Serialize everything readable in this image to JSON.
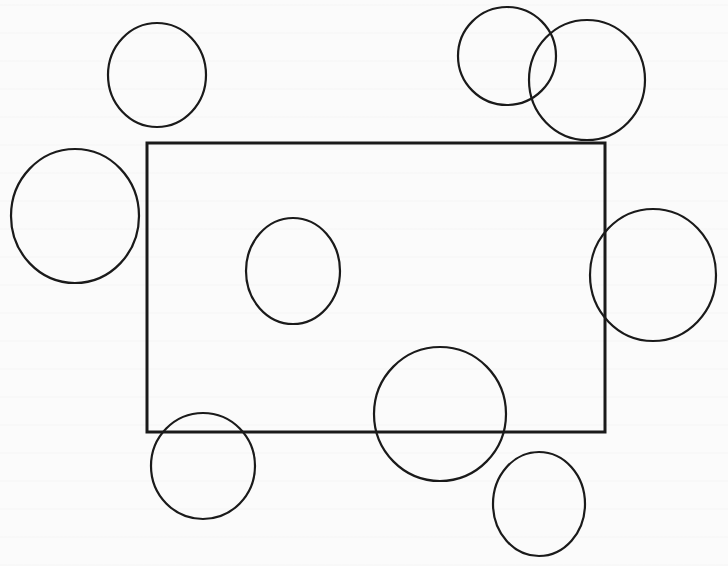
{
  "canvas": {
    "width": 728,
    "height": 566,
    "background": "#fbfbfb",
    "stroke_color": "#1a1a1a"
  },
  "rectangle": {
    "x": 147,
    "y": 143,
    "width": 458,
    "height": 289,
    "stroke_width": 3
  },
  "ellipses": [
    {
      "id": "top-left",
      "cx": 157,
      "cy": 75,
      "rx": 49,
      "ry": 52,
      "stroke_width": 2.2
    },
    {
      "id": "top-right-a",
      "cx": 507,
      "cy": 56,
      "rx": 49,
      "ry": 49,
      "stroke_width": 2.2
    },
    {
      "id": "top-right-b",
      "cx": 587,
      "cy": 80,
      "rx": 58,
      "ry": 60,
      "stroke_width": 2.2
    },
    {
      "id": "left",
      "cx": 75,
      "cy": 216,
      "rx": 64,
      "ry": 67,
      "stroke_width": 2.2
    },
    {
      "id": "inner",
      "cx": 293,
      "cy": 271,
      "rx": 47,
      "ry": 53,
      "stroke_width": 2.2
    },
    {
      "id": "right",
      "cx": 653,
      "cy": 275,
      "rx": 63,
      "ry": 66,
      "stroke_width": 2.2
    },
    {
      "id": "bottom-center",
      "cx": 440,
      "cy": 414,
      "rx": 66,
      "ry": 67,
      "stroke_width": 2.2
    },
    {
      "id": "bottom-left",
      "cx": 203,
      "cy": 466,
      "rx": 52,
      "ry": 53,
      "stroke_width": 2.2
    },
    {
      "id": "bottom-right",
      "cx": 539,
      "cy": 504,
      "rx": 46,
      "ry": 52,
      "stroke_width": 2.2
    }
  ]
}
